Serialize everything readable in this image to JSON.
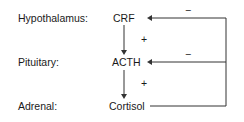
{
  "diagram": {
    "levels": [
      {
        "label": "Hypothalamus:",
        "hormone": "CRF"
      },
      {
        "label": "Pituitary:",
        "hormone": "ACTH"
      },
      {
        "label": "Adrenal:",
        "hormone": "Cortisol"
      }
    ],
    "stimulation_signs": [
      "+",
      "+"
    ],
    "feedback_signs": [
      "−",
      "−"
    ],
    "colors": {
      "line": "#333333",
      "text": "#1a1a1a"
    }
  }
}
